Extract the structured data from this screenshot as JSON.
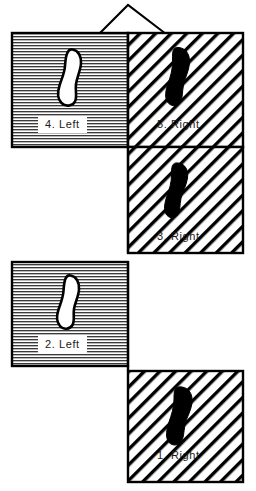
{
  "diagram": {
    "apex": {
      "name": "apex-peak",
      "tip_x": 128,
      "tip_y": 5,
      "left_x": 99,
      "right_x": 166,
      "base_y": 33
    },
    "colors": {
      "ink": "#000000",
      "paper": "#ffffff",
      "label_text": "#1a1a1a",
      "footprint_fill_right": "#000000",
      "footprint_fill_left": "#ffffff"
    },
    "hatch": {
      "left_panel_style": "horizontal-lines",
      "right_panel_style": "diagonal-lines-45",
      "diagonal_spacing_px": 11,
      "horizontal_spacing_px": 3
    },
    "panels": [
      {
        "id": "panel-4",
        "label": "4. Left",
        "step_number": "4",
        "foot": "Left",
        "side": "left",
        "fill": "horizontal",
        "footprint": "outline",
        "label_boxed": true,
        "x": 12,
        "y": 33,
        "w": 116,
        "h": 114,
        "label_x": 38,
        "label_y": 116
      },
      {
        "id": "panel-5",
        "label": "5. Right",
        "step_number": "5",
        "foot": "Right",
        "side": "right",
        "fill": "diagonal",
        "footprint": "solid",
        "label_boxed": false,
        "x": 128,
        "y": 33,
        "w": 115,
        "h": 114,
        "label_x": 153,
        "label_y": 116
      },
      {
        "id": "panel-3",
        "label": "3. Right",
        "step_number": "3",
        "foot": "Right",
        "side": "right",
        "fill": "diagonal",
        "footprint": "solid",
        "label_boxed": false,
        "x": 128,
        "y": 147,
        "w": 115,
        "h": 106,
        "label_x": 153,
        "label_y": 228
      },
      {
        "id": "panel-2",
        "label": "2. Left",
        "step_number": "2",
        "foot": "Left",
        "side": "left",
        "fill": "horizontal",
        "footprint": "outline",
        "label_boxed": true,
        "x": 12,
        "y": 262,
        "w": 116,
        "h": 104,
        "label_x": 38,
        "label_y": 336
      },
      {
        "id": "panel-1",
        "label": "1. Right",
        "step_number": "1",
        "foot": "Right",
        "side": "right",
        "fill": "diagonal",
        "footprint": "solid",
        "label_boxed": false,
        "x": 128,
        "y": 371,
        "w": 115,
        "h": 111,
        "label_x": 153,
        "label_y": 447
      }
    ]
  }
}
